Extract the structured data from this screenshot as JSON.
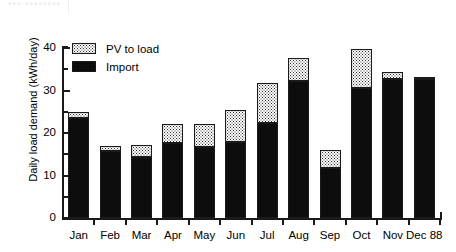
{
  "artifact": {
    "smudge_text": "*** ********",
    "visible": true
  },
  "chart_data": {
    "type": "bar",
    "subtype": "stacked",
    "title": "",
    "xlabel": "",
    "ylabel": "Daily load demand (kWh/day)",
    "categories": [
      "Jan",
      "Feb",
      "Mar",
      "Apr",
      "May",
      "Jun",
      "Jul",
      "Aug",
      "Sep",
      "Oct",
      "Nov",
      "Dec 88"
    ],
    "series": [
      {
        "name": "Import",
        "fill": "solid-black",
        "color": "#0d0d0d",
        "values": [
          23.5,
          15.8,
          14.4,
          17.6,
          16.7,
          17.9,
          22.3,
          32.2,
          11.8,
          30.6,
          32.7,
          32.7
        ]
      },
      {
        "name": "PV to load",
        "fill": "stipple-dots",
        "color": "#ffffff",
        "values": [
          1.5,
          1.2,
          2.8,
          4.5,
          5.4,
          7.5,
          9.4,
          5.4,
          4.2,
          9.2,
          1.6,
          0.5
        ]
      }
    ],
    "totals": [
      25.0,
      17.0,
      17.2,
      22.1,
      22.1,
      25.4,
      31.7,
      37.6,
      16.0,
      39.8,
      34.3,
      33.2
    ],
    "ylim": [
      0,
      40
    ],
    "y_major_ticks": [
      0,
      10,
      20,
      30,
      40
    ],
    "y_minor_ticks": [
      5,
      15,
      25,
      35
    ],
    "y_tick_labels": [
      "0",
      "10",
      "20",
      "30",
      "40"
    ],
    "grid": false,
    "legend_position": "top-left",
    "legend_order": [
      "PV to load",
      "Import"
    ]
  },
  "legend": {
    "items": [
      {
        "label": "PV to load",
        "swatch": "pv"
      },
      {
        "label": "Import",
        "swatch": "import"
      }
    ]
  }
}
